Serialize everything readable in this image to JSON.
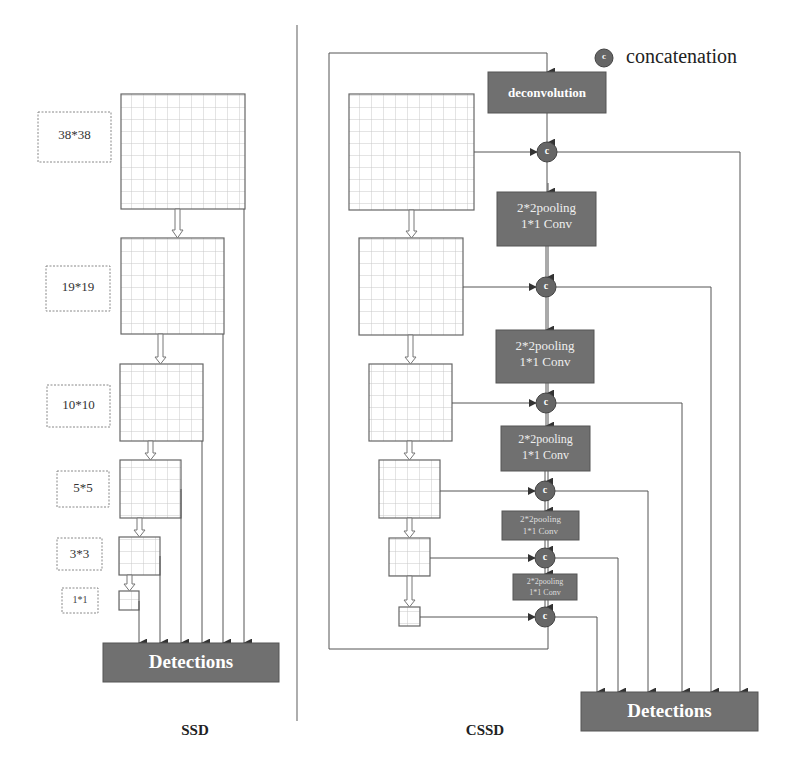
{
  "legend": {
    "symbol": "c",
    "label": "concatenation"
  },
  "ssd": {
    "title": "SSD",
    "detections_label": "Detections",
    "feature_maps": [
      {
        "size_label": "38*38"
      },
      {
        "size_label": "19*19"
      },
      {
        "size_label": "10*10"
      },
      {
        "size_label": "5*5"
      },
      {
        "size_label": "3*3"
      },
      {
        "size_label": "1*1"
      }
    ]
  },
  "cssd": {
    "title": "CSSD",
    "detections_label": "Detections",
    "deconv_label": "deconvolution",
    "concat_symbol": "c",
    "pool_blocks": [
      {
        "line1": "2*2pooling",
        "line2": "1*1 Conv"
      },
      {
        "line1": "2*2pooling",
        "line2": "1*1 Conv"
      },
      {
        "line1": "2*2pooling",
        "line2": "1*1 Conv"
      },
      {
        "line1": "2*2pooling",
        "line2": "1*1 Conv"
      },
      {
        "line1": "2*2pooling",
        "line2": "1*1 Conv"
      }
    ]
  },
  "colors": {
    "block_fill": "#707070",
    "concat_fill": "#666666",
    "line": "#555555",
    "grid_line": "#c8c8c8",
    "block_text": "#ffffff"
  }
}
